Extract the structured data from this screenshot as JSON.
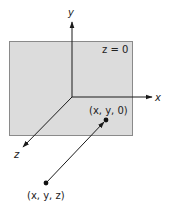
{
  "diagram": {
    "type": "3d-coordinate-projection",
    "plane": {
      "label": "z = 0",
      "fill": "#dcdcdc",
      "stroke": "#8a8a8a"
    },
    "axes": {
      "x": {
        "label": "x"
      },
      "y": {
        "label": "y"
      },
      "z": {
        "label": "z"
      }
    },
    "points": [
      {
        "id": "projected",
        "label": "(x, y, 0)"
      },
      {
        "id": "original",
        "label": "(x, y, z)"
      }
    ],
    "colors": {
      "line": "#1a1a1a",
      "point": "#111111"
    }
  }
}
